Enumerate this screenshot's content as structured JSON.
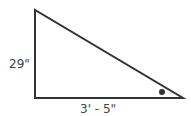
{
  "diagram": {
    "type": "right-triangle",
    "labels": {
      "left_side": "29\"",
      "bottom_side": "3' - 5\""
    },
    "angle_marker": "dot",
    "colors": {
      "stroke": "#333333",
      "text": "#444444",
      "background": "#ffffff"
    }
  }
}
